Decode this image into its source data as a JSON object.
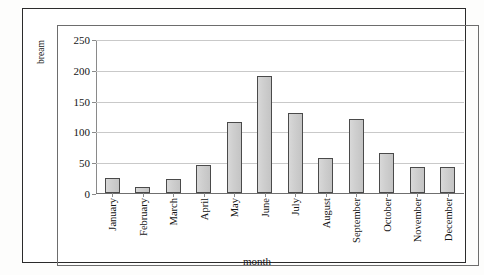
{
  "chart_data": {
    "type": "bar",
    "title": "",
    "xlabel": "month",
    "ylabel": "number of bacterial strains from sea bream",
    "ylabel_line1": "number of bacterial strains from sea",
    "ylabel_line2": "bream",
    "categories": [
      "January",
      "February",
      "March",
      "April",
      "May",
      "June",
      "July",
      "August",
      "September",
      "October",
      "November",
      "December"
    ],
    "values": [
      25,
      10,
      22,
      46,
      115,
      190,
      130,
      57,
      120,
      65,
      43,
      42
    ],
    "ylim": [
      0,
      250
    ],
    "yticks": [
      0,
      50,
      100,
      150,
      200,
      250
    ],
    "ytick_labels": [
      "0",
      "50",
      "100",
      "150",
      "200",
      "250"
    ],
    "grid": true,
    "legend": "none",
    "bar_fill": "#cfcfcf",
    "bar_border": "#4a4a4a",
    "gridline_color": "#c9c9c9",
    "axis_color": "#6f6f6f"
  }
}
